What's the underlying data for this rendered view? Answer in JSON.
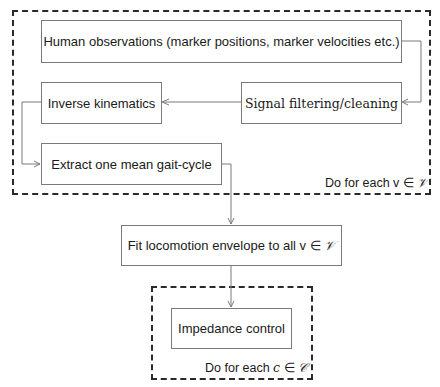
{
  "diagram": {
    "boxes": {
      "observations": "Human observations (marker positions, marker velocities etc.)",
      "filtering": "Signal filtering/cleaning",
      "inverse_kinematics": "Inverse kinematics",
      "extract": "Extract one mean gait-cycle",
      "fit_prefix": "Fit locomotion envelope to all v ∈ ",
      "fit_set": "𝒱",
      "impedance": "Impedance control"
    },
    "loops": {
      "outer_prefix": "Do for each v ∈ ",
      "outer_set": "𝒱",
      "inner_prefix": "Do for each ",
      "inner_var": "c",
      "inner_in": " ∈ ",
      "inner_set": "𝒞"
    },
    "edges": [
      {
        "from": "observations",
        "to": "filtering"
      },
      {
        "from": "filtering",
        "to": "inverse_kinematics"
      },
      {
        "from": "inverse_kinematics",
        "to": "extract"
      },
      {
        "from": "extract",
        "to": "fit"
      },
      {
        "from": "fit",
        "to": "impedance"
      }
    ]
  }
}
